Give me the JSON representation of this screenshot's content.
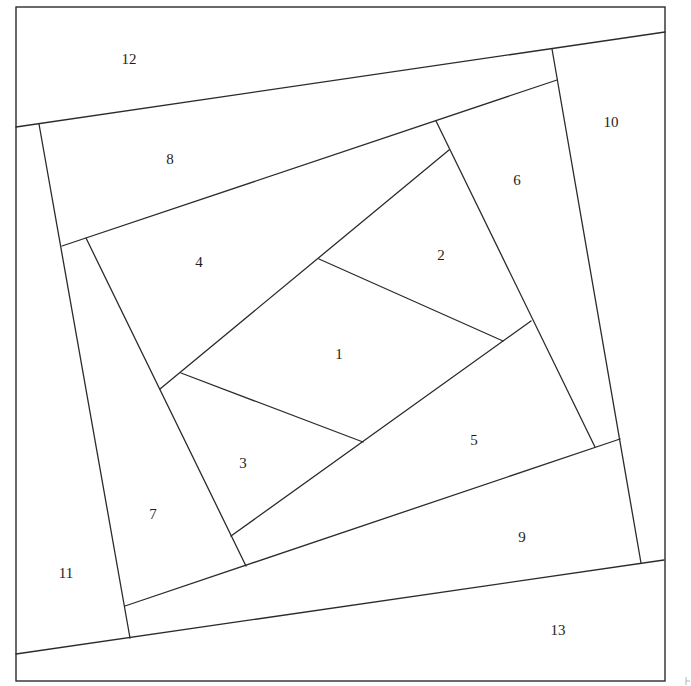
{
  "diagram": {
    "type": "paper-piecing-pattern",
    "colors": {
      "line": "#2b2b2b",
      "background": "#ffffff",
      "label": "#1e1e1e"
    },
    "border": {
      "x1": 16,
      "y1": 7,
      "x2": 665,
      "y2": 681
    },
    "pieces": [
      {
        "id": "1",
        "label": "1",
        "x": 339,
        "y": 356
      },
      {
        "id": "2",
        "label": "2",
        "x": 441,
        "y": 257
      },
      {
        "id": "3",
        "label": "3",
        "x": 243,
        "y": 465
      },
      {
        "id": "4",
        "label": "4",
        "x": 199,
        "y": 264
      },
      {
        "id": "5",
        "label": "5",
        "x": 474,
        "y": 442
      },
      {
        "id": "6",
        "label": "6",
        "x": 517,
        "y": 182
      },
      {
        "id": "7",
        "label": "7",
        "x": 153,
        "y": 516
      },
      {
        "id": "8",
        "label": "8",
        "x": 170,
        "y": 161
      },
      {
        "id": "9",
        "label": "9",
        "x": 522,
        "y": 539
      },
      {
        "id": "10",
        "label": "10",
        "x": 611,
        "y": 124
      },
      {
        "id": "11",
        "label": "11",
        "x": 66,
        "y": 575
      },
      {
        "id": "12",
        "label": "12",
        "x": 129,
        "y": 61
      },
      {
        "id": "13",
        "label": "13",
        "x": 558,
        "y": 632
      }
    ],
    "seams": [
      {
        "name": "seam-1-3",
        "x1": 181,
        "y1": 373,
        "x2": 363,
        "y2": 442
      },
      {
        "name": "seam-1-2",
        "x1": 319,
        "y1": 259,
        "x2": 503,
        "y2": 341
      },
      {
        "name": "seam-4",
        "x1": 160,
        "y1": 389,
        "x2": 449,
        "y2": 150
      },
      {
        "name": "seam-5",
        "x1": 231,
        "y1": 536,
        "x2": 531,
        "y2": 321
      },
      {
        "name": "seam-6",
        "x1": 436,
        "y1": 121,
        "x2": 595,
        "y2": 447
      },
      {
        "name": "seam-7",
        "x1": 86,
        "y1": 238,
        "x2": 246,
        "y2": 566
      },
      {
        "name": "seam-8",
        "x1": 62,
        "y1": 246,
        "x2": 557,
        "y2": 80
      },
      {
        "name": "seam-9",
        "x1": 125,
        "y1": 606,
        "x2": 620,
        "y2": 439
      },
      {
        "name": "seam-10",
        "x1": 552,
        "y1": 49,
        "x2": 641,
        "y2": 563
      },
      {
        "name": "seam-11",
        "x1": 39,
        "y1": 124,
        "x2": 130,
        "y2": 638
      },
      {
        "name": "seam-12",
        "x1": 16,
        "y1": 127,
        "x2": 665,
        "y2": 32
      },
      {
        "name": "seam-13",
        "x1": 16,
        "y1": 654,
        "x2": 664,
        "y2": 560
      }
    ]
  }
}
